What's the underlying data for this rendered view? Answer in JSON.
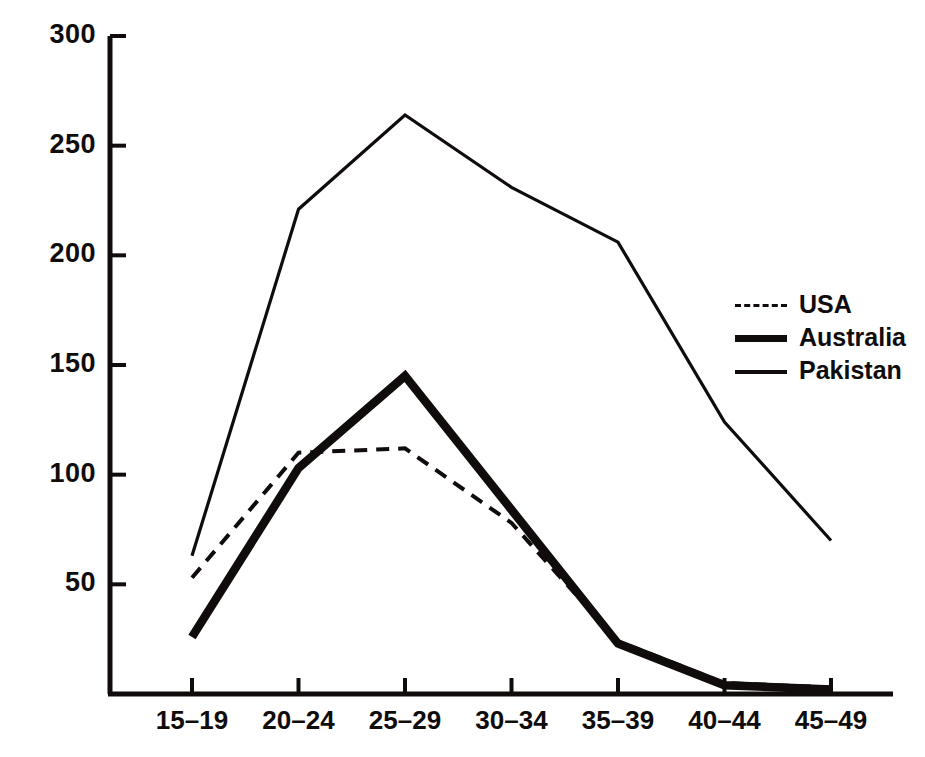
{
  "chart_data": {
    "type": "line",
    "title": "",
    "subtitle": "",
    "xlabel": "",
    "ylabel": "",
    "categories": [
      "15-19",
      "20-24",
      "25-29",
      "30-34",
      "35-39",
      "40-44",
      "45-49"
    ],
    "ylim": [
      0,
      300
    ],
    "yticks": [
      50,
      100,
      150,
      200,
      250,
      300
    ],
    "ytick_labels": [
      "50",
      "100",
      "150",
      "200",
      "250",
      "300"
    ],
    "grid": false,
    "legend_position": "right",
    "series": [
      {
        "name": "USA",
        "style": "dashed",
        "values": [
          53,
          110,
          112,
          78,
          24,
          5,
          3
        ]
      },
      {
        "name": "Australia",
        "style": "thick-solid",
        "values": [
          26,
          103,
          145,
          84,
          23,
          4,
          2
        ]
      },
      {
        "name": "Pakistan",
        "style": "thin-solid",
        "values": [
          63,
          221,
          264,
          231,
          206,
          124,
          70
        ]
      }
    ]
  },
  "legend": {
    "items": [
      {
        "label": "USA",
        "swatch": "dashed-line-swatch"
      },
      {
        "label": "Australia",
        "swatch": "thick-line-swatch"
      },
      {
        "label": "Pakistan",
        "swatch": "thin-line-swatch"
      }
    ]
  },
  "axes": {
    "y_tick_labels": [
      "300",
      "250",
      "200",
      "150",
      "100",
      "50"
    ],
    "x_tick_labels": [
      "15-19",
      "20-24",
      "25-29",
      "30-34",
      "35-39",
      "40-44",
      "45-49"
    ]
  },
  "colors": {
    "ink": "#100c0c",
    "background": "#ffffff"
  }
}
